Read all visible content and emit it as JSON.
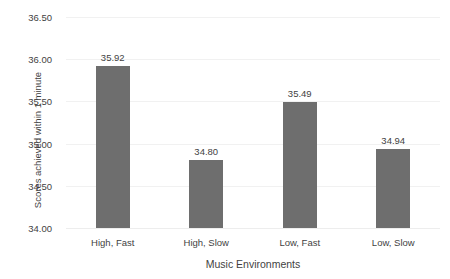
{
  "chart_data": {
    "type": "bar",
    "title": "",
    "xlabel": "Music Environments",
    "ylabel": "Scores achieved within 1 minute",
    "categories": [
      "High, Fast",
      "High, Slow",
      "Low, Fast",
      "Low, Slow"
    ],
    "values": [
      35.92,
      34.8,
      35.49,
      34.94
    ],
    "value_labels": [
      "35.92",
      "34.80",
      "35.49",
      "34.94"
    ],
    "ylim": [
      34.0,
      36.5
    ],
    "ytick_step": 0.5,
    "ytick_labels": [
      "36.50",
      "36.00",
      "35.50",
      "35.00",
      "34.50",
      "34.00"
    ],
    "ytick_values": [
      36.5,
      36.0,
      35.5,
      35.0,
      34.5,
      34.0
    ],
    "grid": true,
    "legend": false,
    "series": [
      {
        "name": "Scores achieved within 1 minute",
        "values": [
          35.92,
          34.8,
          35.49,
          34.94
        ],
        "color": "#6e6e6e"
      }
    ],
    "colors": {
      "bar": "#6e6e6e",
      "gridline": "#f1f1f1",
      "background": "#ffffff",
      "text": "#3f3f3f"
    }
  }
}
